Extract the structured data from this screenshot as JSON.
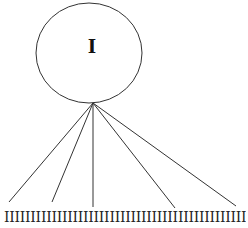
{
  "diagram": {
    "type": "tree",
    "root": {
      "label": "I",
      "shape": "ellipse",
      "cx": 89,
      "cy": 53,
      "rx": 53,
      "ry": 50
    },
    "apex": {
      "x": 93,
      "y": 103
    },
    "edges": [
      {
        "x2": 9,
        "y2": 202
      },
      {
        "x2": 52,
        "y2": 202
      },
      {
        "x2": 93,
        "y2": 207
      },
      {
        "x2": 175,
        "y2": 208
      },
      {
        "x2": 236,
        "y2": 206
      }
    ],
    "leaves": {
      "glyph": "I",
      "count": 46,
      "text": "IIIIIIIIIIIIIIIIIIIIIIIIIIIIIIIIIIIIIIIIIIIIII"
    },
    "colors": {
      "stroke": "#333333",
      "background": "#ffffff"
    }
  }
}
